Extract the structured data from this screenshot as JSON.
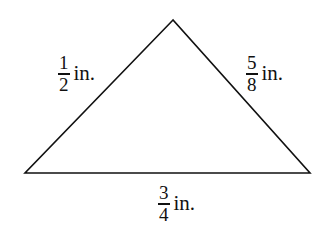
{
  "diagram": {
    "type": "triangle",
    "stroke_color": "#111111",
    "background": "#ffffff",
    "vertices": {
      "apex": [
        173,
        20
      ],
      "bottom_left": [
        25,
        173
      ],
      "bottom_right": [
        310,
        173
      ]
    },
    "sides": {
      "left": {
        "numerator": "1",
        "denominator": "2",
        "unit": "in."
      },
      "right": {
        "numerator": "5",
        "denominator": "8",
        "unit": "in."
      },
      "bottom": {
        "numerator": "3",
        "denominator": "4",
        "unit": "in."
      }
    }
  }
}
